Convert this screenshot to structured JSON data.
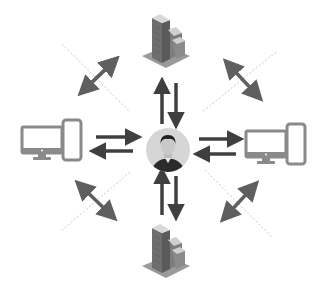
{
  "diagram": {
    "type": "hub-and-spoke network",
    "center": {
      "label": "",
      "icon": "user-avatar-icon"
    },
    "nodes": [
      {
        "id": "top",
        "icon": "office-building-icon",
        "position": "top"
      },
      {
        "id": "bottom",
        "icon": "office-building-icon",
        "position": "bottom"
      },
      {
        "id": "left",
        "icon": "desktop-and-tablet-icon",
        "position": "left"
      },
      {
        "id": "right",
        "icon": "desktop-and-tablet-icon",
        "position": "right"
      }
    ],
    "connections": [
      {
        "from": "center",
        "to": "top",
        "style": "two-opposing-arrows"
      },
      {
        "from": "center",
        "to": "bottom",
        "style": "two-opposing-arrows"
      },
      {
        "from": "center",
        "to": "left",
        "style": "two-opposing-arrows"
      },
      {
        "from": "center",
        "to": "right",
        "style": "two-opposing-arrows"
      }
    ],
    "diagonals": [
      {
        "position": "top-left",
        "style": "double-headed-arrow-across-dotted-line"
      },
      {
        "position": "top-right",
        "style": "double-headed-arrow-across-dotted-line"
      },
      {
        "position": "bottom-left",
        "style": "double-headed-arrow-across-dotted-line"
      },
      {
        "position": "bottom-right",
        "style": "double-headed-arrow-across-dotted-line"
      }
    ],
    "colors": {
      "arrow": "#5f5f5f",
      "arrow_dark": "#3a3a3a",
      "device": "#8a8a8a",
      "dotted_line": "#c8c8c8",
      "avatar_bg": "#d6d6d6"
    }
  }
}
